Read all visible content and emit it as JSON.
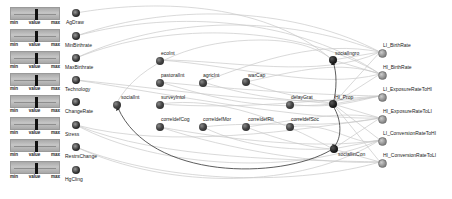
{
  "sliders": [
    {
      "param": "AgDraw",
      "min_label": "min",
      "value_label": "value",
      "max_label": "max"
    },
    {
      "param": "MinBirthrate",
      "min_label": "min",
      "value_label": "value",
      "max_label": "max"
    },
    {
      "param": "MaxBirthrate",
      "min_label": "min",
      "value_label": "value",
      "max_label": "max"
    },
    {
      "param": "Technology",
      "min_label": "min",
      "value_label": "value",
      "max_label": "max"
    },
    {
      "param": "ChangeRate",
      "min_label": "min",
      "value_label": "value",
      "max_label": "max"
    },
    {
      "param": "Stress",
      "min_label": "min",
      "value_label": "value",
      "max_label": "max"
    },
    {
      "param": "RestrsChange",
      "min_label": "min",
      "value_label": "value",
      "max_label": "max"
    },
    {
      "param": "HgCling",
      "min_label": "min",
      "value_label": "value",
      "max_label": "max"
    }
  ],
  "input_nodes": [
    {
      "label": "AgDraw"
    },
    {
      "label": "MinBirthrate"
    },
    {
      "label": "MaxBirthrate"
    },
    {
      "label": "Technology"
    },
    {
      "label": "ChangeRate"
    },
    {
      "label": "Stress"
    },
    {
      "label": "RestrsChange"
    },
    {
      "label": "HgCling"
    }
  ],
  "middle_nodes": [
    {
      "label": "ecoInt"
    },
    {
      "label": "pastoralInt"
    },
    {
      "label": "agricInt"
    },
    {
      "label": "warCap"
    },
    {
      "label": "socialInt"
    },
    {
      "label": "surveyIntol"
    },
    {
      "label": "delayGrat"
    },
    {
      "label": "HI_Prop"
    },
    {
      "label": "socialIngro"
    },
    {
      "label": "correldefCog"
    },
    {
      "label": "correldefMor"
    },
    {
      "label": "correldefRit"
    },
    {
      "label": "correldefSoc"
    },
    {
      "label": "socialIinCon"
    }
  ],
  "output_nodes": [
    {
      "label": "LI_BirthRate"
    },
    {
      "label": "HI_BirthRate"
    },
    {
      "label": "LI_ExposureRateToHI"
    },
    {
      "label": "HI_ExposureRateToLI"
    },
    {
      "label": "LI_ConversionRateToHI"
    },
    {
      "label": "HI_ConversionRateToLI"
    }
  ],
  "colors": {
    "edge": "#c8c8c8",
    "highlight_edge": "#333333",
    "node_dark": "#2a2a2a",
    "node_output": "#999999"
  }
}
